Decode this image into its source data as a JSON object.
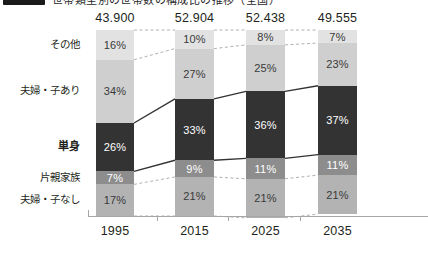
{
  "title": {
    "badge_label": "",
    "text": "世帯類型別の世帯数の構成比の推移（全国）"
  },
  "chart_data": {
    "type": "bar",
    "subtype": "100% stacked bar",
    "title": "世帯類型別の世帯数の構成比の推移（全国）",
    "xlabel": "",
    "ylabel": "",
    "ylim": [
      0,
      100
    ],
    "grid": false,
    "legend_position": "left-axis-labels",
    "categories": [
      "1995",
      "2015",
      "2025",
      "2035"
    ],
    "totals": [
      "43.900",
      "52.904",
      "52.438",
      "49.555"
    ],
    "stack_order_top_to_bottom": [
      "その他",
      "夫婦・子あり",
      "単身",
      "片親家族",
      "夫婦・子なし"
    ],
    "series": [
      {
        "name": "その他",
        "color": "#e2e2e2",
        "values": [
          16,
          10,
          8,
          7
        ],
        "labels": [
          "16%",
          "10%",
          "8%",
          "7%"
        ]
      },
      {
        "name": "夫婦・子あり",
        "color": "#cfcfcf",
        "values": [
          34,
          27,
          25,
          23
        ],
        "labels": [
          "34%",
          "27%",
          "25%",
          "23%"
        ]
      },
      {
        "name": "単身",
        "color": "#333333",
        "values": [
          26,
          33,
          36,
          37
        ],
        "labels": [
          "26%",
          "33%",
          "36%",
          "37%"
        ],
        "emphasis": true
      },
      {
        "name": "片親家族",
        "color": "#8d8d8d",
        "values": [
          7,
          9,
          11,
          11
        ],
        "labels": [
          "7%",
          "9%",
          "11%",
          "11%"
        ]
      },
      {
        "name": "夫婦・子なし",
        "color": "#b3b3b3",
        "values": [
          17,
          21,
          21,
          21
        ],
        "labels": [
          "17%",
          "21%",
          "21%",
          "21%"
        ]
      }
    ]
  }
}
